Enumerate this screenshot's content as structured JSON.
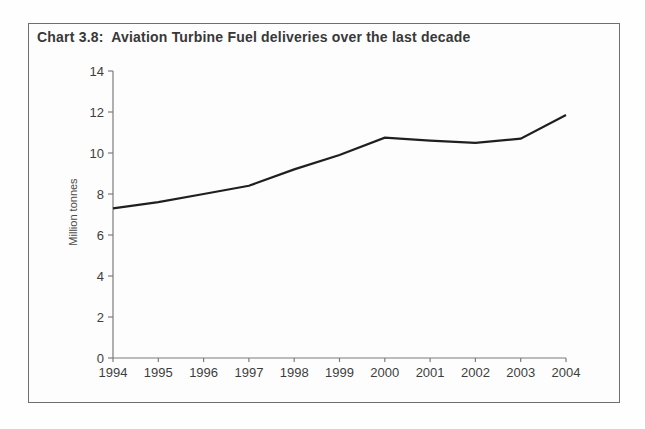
{
  "chart_data": {
    "type": "line",
    "title": "Chart 3.8:  Aviation Turbine Fuel deliveries over the last decade",
    "ylabel": "Million tonnes",
    "xlabel": "",
    "x": [
      1994,
      1995,
      1996,
      1997,
      1998,
      1999,
      2000,
      2001,
      2002,
      2003,
      2004
    ],
    "series": [
      {
        "name": "Aviation turbine fuel deliveries",
        "values": [
          7.3,
          7.6,
          8.0,
          8.4,
          9.2,
          9.9,
          10.75,
          10.6,
          10.5,
          10.7,
          11.85
        ]
      }
    ],
    "ylim": [
      0,
      14
    ],
    "ytick_step": 2,
    "grid": false,
    "legend": "none",
    "line_color": "#1f1f1f",
    "axis_color": "#7d7d7d",
    "tick_label_color": "#3d3d3d",
    "border_color": "#6e6e6e",
    "background_color": "#fdfdfd"
  }
}
